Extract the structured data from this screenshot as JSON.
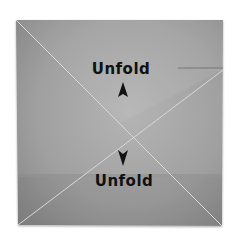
{
  "diagram": {
    "paper_color": "#9a9a9a",
    "crease_color": "#d8d8d8",
    "labels": [
      {
        "id": "top",
        "text": "Unfold",
        "arrow": "up"
      },
      {
        "id": "bottom",
        "text": "Unfold",
        "arrow": "down"
      }
    ]
  }
}
